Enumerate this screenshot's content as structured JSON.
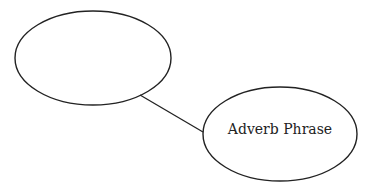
{
  "diagram": {
    "nodes": [
      {
        "id": "root",
        "label": "",
        "cx": 93,
        "cy": 58,
        "rx": 78,
        "ry": 47
      },
      {
        "id": "adverb-phrase",
        "label": "Adverb Phrase",
        "cx": 280,
        "cy": 134,
        "rx": 77,
        "ry": 47
      }
    ],
    "edges": [
      {
        "from": "root",
        "to": "adverb-phrase",
        "x1": 140,
        "y1": 95,
        "x2": 203,
        "y2": 132
      }
    ],
    "stroke_color": "#222222"
  }
}
